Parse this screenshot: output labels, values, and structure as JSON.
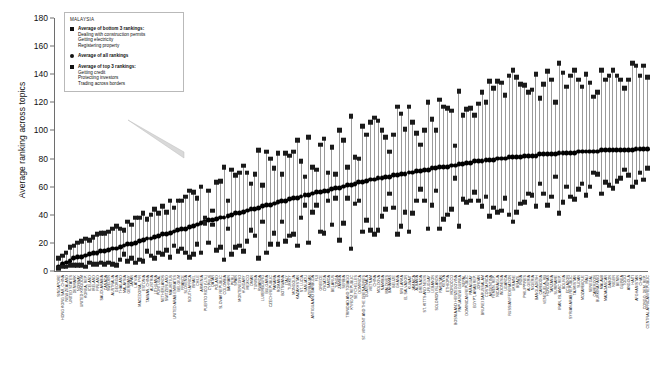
{
  "chart_data": {
    "type": "scatter",
    "title": "",
    "xlabel": "",
    "ylabel": "Average ranking across topics",
    "ylim": [
      0,
      180
    ],
    "yticks": [
      0,
      20,
      40,
      60,
      80,
      100,
      120,
      140,
      160,
      180
    ],
    "grid": false,
    "legend_position": "top-left-inset",
    "series": [
      {
        "name": "Average of bottom 3 rankings: Dealing with construction permits, Getting electricity, Registering property",
        "marker": "square"
      },
      {
        "name": "Average of all rankings",
        "marker": "circle"
      },
      {
        "name": "Average of top 3 rankings: Getting credit, Protecting investors, Trading across borders",
        "marker": "square"
      }
    ],
    "categories": [
      "SINGAPORE",
      "HONG KONG SAR, CHINA",
      "NEW ZEALAND",
      "UNITED STATES",
      "DENMARK",
      "NORWAY",
      "UNITED KINGDOM",
      "KOREA, REP.",
      "ICELAND",
      "IRELAND",
      "FINLAND",
      "SAUDI ARABIA",
      "CANADA",
      "SWEDEN",
      "AUSTRALIA",
      "GEORGIA",
      "THAILAND",
      "MALAYSIA",
      "GERMANY",
      "JAPAN",
      "LATVIA",
      "MACEDONIA, FYR",
      "ESTONIA",
      "TAIWAN, CHINA",
      "AUSTRIA",
      "LITHUANIA",
      "PORTUGAL",
      "NETHERLANDS",
      "SWITZERLAND",
      "MAURITIUS",
      "UNITED ARAB EMIRATES",
      "BELGIUM",
      "FRANCE",
      "SLOVENIA",
      "SOUTH AFRICA",
      "ISRAEL",
      "CHILE",
      "ARMENIA",
      "PUERTO RICO (U.S.)",
      "CYPRUS",
      "QATAR",
      "POLAND",
      "SLOVAK REPUBLIC",
      "COLOMBIA",
      "BAHRAIN",
      "PERU",
      "SPAIN",
      "MONTENEGRO",
      "HUNGARY",
      "MEXICO",
      "OMAN",
      "TUNISIA",
      "RWANDA",
      "LUXEMBOURG",
      "BULGARIA",
      "CZECH REPUBLIC",
      "PANAMA",
      "ROMANIA",
      "BOTSWANA",
      "ITALY",
      "TURKEY",
      "MONGOLIA",
      "KAZAKHSTAN",
      "ST. LUCIA",
      "VANUATU",
      "AZERBAIJAN",
      "ANTIGUA AND BARBUDA",
      "FIJI",
      "GREECE",
      "CROATIA",
      "SAMOA",
      "BELARUS",
      "TONGA",
      "ZAMBIA",
      "SERBIA",
      "TRINIDAD AND TOBAGO",
      "KYRGYZ REPUBLIC",
      "SEYCHELLES",
      "DOMINICA",
      "ST. VINCENT AND THE GRENADINES",
      "GUATEMALA",
      "VIETNAM",
      "CHINA",
      "MOLDOVA",
      "NAMIBIA",
      "MALDIVES",
      "BAHAMAS",
      "BELIZE",
      "GHANA",
      "SRI LANKA",
      "EL SALVADOR",
      "KUWAIT",
      "JAMAICA",
      "ALBANIA",
      "GRENADA",
      "ST. KITTS AND NEVIS",
      "URUGUAY",
      "LEBANON",
      "SOLOMON ISLANDS",
      "PAKISTAN",
      "KENYA",
      "ETHIOPIA",
      "MOROCCO",
      "BOSNIA AND HERZEGOVINA",
      "PAPUA NEW GUINEA",
      "NEPAL",
      "DOMINICAN REPUBLIC",
      "PARAGUAY",
      "EGYPT, ARAB REP.",
      "JORDAN",
      "BRUNEI DARUSSALAM",
      "COSTA RICA",
      "ARGENTINA",
      "YEMEN, REP.",
      "NICARAGUA",
      "INDONESIA",
      "UGANDA",
      "RUSSIAN FEDERATION",
      "UKRAINE",
      "BRAZIL",
      "INDIA",
      "PHILIPPINES",
      "ALGERIA",
      "NIGERIA",
      "BANGLADESH",
      "CAMBODIA",
      "VENEZUELA, RB",
      "HONDURAS",
      "TANZANIA",
      "SURINAME",
      "IRAN, ISLAMIC REP.",
      "BOLIVIA",
      "ECUADOR",
      "SYRIAN ARAB REPUBLIC",
      "TAJIKISTAN",
      "SUDAN",
      "MOZAMBIQUE",
      "MALI",
      "SENEGAL",
      "CAMEROON",
      "BURKINA FASO",
      "MALAWI",
      "MADAGASCAR",
      "GABON",
      "NIGER",
      "BENIN",
      "GUINEA",
      "TOGO",
      "ANGOLA",
      "HAITI",
      "AFGHANISTAN",
      "CHAD",
      "CONGO, DEM. REP.",
      "CENTRAL AFRICAN REPUBLIC"
    ],
    "avg_all": [
      3,
      5,
      6,
      7,
      9,
      10,
      10,
      11,
      12,
      13,
      13,
      14,
      14,
      15,
      16,
      16,
      17,
      18,
      19,
      19,
      20,
      21,
      22,
      23,
      23,
      24,
      25,
      26,
      26,
      27,
      28,
      29,
      30,
      30,
      31,
      32,
      33,
      34,
      35,
      36,
      36,
      37,
      38,
      38,
      39,
      40,
      41,
      41,
      42,
      43,
      44,
      44,
      45,
      46,
      47,
      47,
      48,
      49,
      50,
      50,
      51,
      52,
      52,
      53,
      54,
      54,
      55,
      56,
      56,
      57,
      57,
      58,
      59,
      59,
      60,
      61,
      61,
      62,
      63,
      63,
      64,
      65,
      65,
      66,
      66,
      67,
      67,
      68,
      68,
      69,
      69,
      70,
      70,
      71,
      71,
      72,
      72,
      73,
      73,
      74,
      74,
      74,
      75,
      75,
      76,
      76,
      77,
      77,
      78,
      78,
      78,
      79,
      79,
      79,
      80,
      80,
      80,
      81,
      81,
      81,
      81,
      82,
      82,
      82,
      82,
      83,
      83,
      83,
      83,
      83,
      84,
      84,
      84,
      84,
      84,
      85,
      85,
      85,
      85,
      85,
      85,
      86,
      86,
      86,
      86,
      86,
      86,
      86,
      86,
      86,
      87,
      87,
      87,
      87,
      87,
      87,
      87
    ],
    "avg_top3": [
      2,
      3,
      3,
      4,
      4,
      4,
      4,
      3,
      6,
      5,
      5,
      6,
      5,
      6,
      5,
      4,
      8,
      12,
      7,
      9,
      6,
      8,
      7,
      14,
      11,
      9,
      13,
      12,
      15,
      10,
      18,
      14,
      16,
      13,
      10,
      12,
      19,
      13,
      34,
      20,
      43,
      15,
      17,
      8,
      30,
      12,
      17,
      18,
      14,
      21,
      29,
      25,
      9,
      35,
      13,
      19,
      27,
      19,
      35,
      21,
      25,
      26,
      18,
      38,
      47,
      20,
      42,
      47,
      28,
      27,
      50,
      33,
      52,
      22,
      34,
      52,
      16,
      48,
      50,
      28,
      36,
      29,
      26,
      29,
      39,
      44,
      55,
      45,
      26,
      32,
      42,
      28,
      41,
      50,
      58,
      50,
      30,
      47,
      57,
      30,
      37,
      40,
      44,
      66,
      32,
      51,
      49,
      50,
      56,
      50,
      46,
      53,
      39,
      45,
      42,
      43,
      52,
      40,
      35,
      42,
      48,
      49,
      55,
      54,
      46,
      62,
      55,
      47,
      53,
      67,
      41,
      49,
      60,
      53,
      51,
      58,
      62,
      54,
      60,
      70,
      69,
      55,
      63,
      61,
      59,
      64,
      66,
      72,
      68,
      60,
      63,
      70,
      65,
      73,
      72,
      67,
      79
    ],
    "avg_bottom3": [
      9,
      11,
      13,
      17,
      18,
      20,
      21,
      23,
      22,
      24,
      26,
      27,
      27,
      28,
      30,
      32,
      30,
      29,
      35,
      33,
      38,
      38,
      41,
      37,
      40,
      44,
      41,
      46,
      42,
      50,
      45,
      50,
      50,
      53,
      57,
      56,
      52,
      60,
      38,
      57,
      33,
      63,
      64,
      74,
      50,
      72,
      68,
      70,
      75,
      70,
      62,
      69,
      86,
      61,
      85,
      80,
      73,
      84,
      69,
      84,
      82,
      85,
      93,
      78,
      67,
      95,
      74,
      72,
      90,
      94,
      70,
      88,
      69,
      100,
      93,
      74,
      110,
      81,
      80,
      103,
      97,
      106,
      109,
      107,
      100,
      95,
      85,
      97,
      117,
      112,
      101,
      117,
      106,
      98,
      90,
      100,
      120,
      108,
      100,
      122,
      117,
      116,
      114,
      89,
      128,
      111,
      115,
      116,
      111,
      119,
      127,
      120,
      135,
      130,
      135,
      134,
      125,
      139,
      143,
      138,
      133,
      132,
      127,
      129,
      140,
      123,
      133,
      142,
      136,
      120,
      148,
      141,
      131,
      139,
      143,
      136,
      131,
      140,
      134,
      124,
      127,
      143,
      136,
      139,
      143,
      139,
      136,
      130,
      136,
      148,
      146,
      139,
      146,
      138,
      141,
      148,
      136
    ]
  },
  "legend": {
    "country": "MALAYSIA",
    "items": [
      {
        "marker": "square",
        "lead": "Average of bottom 3 rankings:",
        "detail": "Dealing with construction permits, Getting electricity, Registering property"
      },
      {
        "marker": "circle",
        "lead": "Average of all rankings",
        "detail": ""
      },
      {
        "marker": "square",
        "lead": "Average of top 3 rankings:",
        "detail": "Getting credit, Protecting investors, Trading across borders"
      }
    ]
  }
}
